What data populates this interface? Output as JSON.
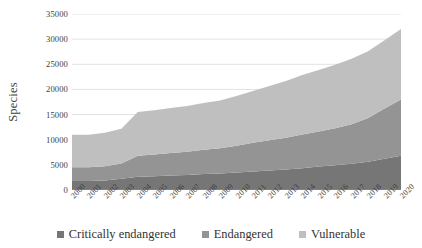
{
  "chart_data": {
    "type": "area",
    "title": "",
    "subtitle": "",
    "xlabel": "",
    "ylabel": "Species",
    "stacked": true,
    "grid": true,
    "legend_position": "bottom",
    "ylim": [
      0,
      35000
    ],
    "ytick_labels": [
      "0",
      "5000",
      "10000",
      "15000",
      "20000",
      "25000",
      "30000",
      "35000"
    ],
    "ytick_values": [
      0,
      5000,
      10000,
      15000,
      20000,
      25000,
      30000,
      35000
    ],
    "categories": [
      "2000",
      "2001",
      "2002",
      "2003",
      "2004",
      "2005",
      "2006",
      "2007",
      "2008",
      "2009",
      "2010",
      "2011",
      "2012",
      "2013",
      "2014",
      "2015",
      "2016",
      "2017",
      "2018",
      "2019",
      "2020"
    ],
    "series": [
      {
        "name": "Critically endangered",
        "color": "#767676",
        "values": [
          1800,
          1800,
          1900,
          2250,
          2650,
          2750,
          2900,
          3000,
          3200,
          3300,
          3500,
          3700,
          3900,
          4100,
          4350,
          4650,
          4900,
          5200,
          5600,
          6200,
          6800
        ]
      },
      {
        "name": "Endangered",
        "color": "#949494",
        "values": [
          2700,
          2700,
          2800,
          3000,
          4150,
          4300,
          4450,
          4600,
          4800,
          5000,
          5300,
          5700,
          6000,
          6300,
          6700,
          7000,
          7400,
          7900,
          8700,
          10000,
          11200
        ]
      },
      {
        "name": "Vulnerable",
        "color": "#bfbfbf",
        "values": [
          6500,
          6500,
          6700,
          6950,
          8700,
          8800,
          8950,
          9100,
          9300,
          9500,
          9900,
          10300,
          10800,
          11300,
          11800,
          12200,
          12600,
          13000,
          13300,
          13600,
          14000
        ]
      }
    ],
    "cumulative_totals": [
      11000,
      11000,
      11400,
      12200,
      15500,
      15850,
      16300,
      16700,
      17300,
      17800,
      18700,
      19700,
      20700,
      21700,
      22850,
      23850,
      24900,
      26100,
      27600,
      29800,
      32000
    ]
  },
  "legend": {
    "items": [
      {
        "label": "Critically endangered",
        "color": "#767676"
      },
      {
        "label": "Endangered",
        "color": "#949494"
      },
      {
        "label": "Vulnerable",
        "color": "#bfbfbf"
      }
    ]
  },
  "axes": {
    "y_title": "Species"
  }
}
